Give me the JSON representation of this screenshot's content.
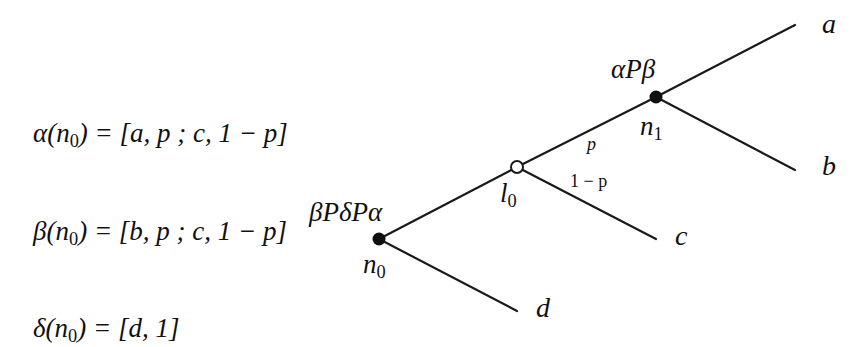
{
  "formulas": [
    {
      "lhs": "α(n",
      "sub": "0",
      "rhs": ") = [a, p ; c, 1 − p]"
    },
    {
      "lhs": "β(n",
      "sub": "0",
      "rhs": ") = [b, p ; c, 1 − p]"
    },
    {
      "lhs": "δ(n",
      "sub": "0",
      "rhs": ") = [d, 1]"
    }
  ],
  "tree": {
    "nodes": {
      "n0": {
        "name": "n",
        "sub": "0",
        "type": "decision",
        "preference": "βPδPα",
        "x": 379,
        "y": 239
      },
      "l0": {
        "name": "l",
        "sub": "0",
        "type": "lottery",
        "x": 517,
        "y": 167
      },
      "n1": {
        "name": "n",
        "sub": "1",
        "type": "decision",
        "preference": "αPβ",
        "x": 656,
        "y": 97
      }
    },
    "edges": [
      {
        "from": "n0",
        "to": "l0"
      },
      {
        "from": "n0",
        "to": "d"
      },
      {
        "from": "l0",
        "to": "n1",
        "prob": "p"
      },
      {
        "from": "l0",
        "to": "c",
        "prob": "1 − p"
      },
      {
        "from": "n1",
        "to": "a"
      },
      {
        "from": "n1",
        "to": "b"
      }
    ],
    "outcomes": {
      "a": "a",
      "b": "b",
      "c": "c",
      "d": "d"
    },
    "probabilities": {
      "upper": "p",
      "lower": "1 − p"
    }
  }
}
